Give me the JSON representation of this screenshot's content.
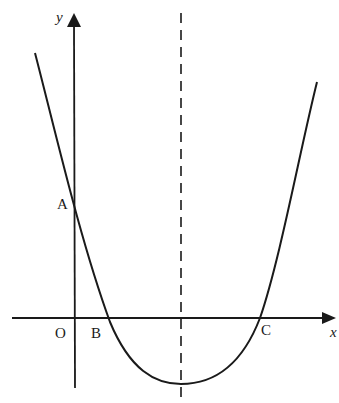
{
  "diagram": {
    "type": "parabola-graph",
    "axes": {
      "x_label": "x",
      "y_label": "y",
      "origin_label": "O"
    },
    "points": {
      "A": "A",
      "B": "B",
      "C": "C"
    },
    "colors": {
      "stroke": "#1a1a1a",
      "background": "#ffffff"
    }
  }
}
